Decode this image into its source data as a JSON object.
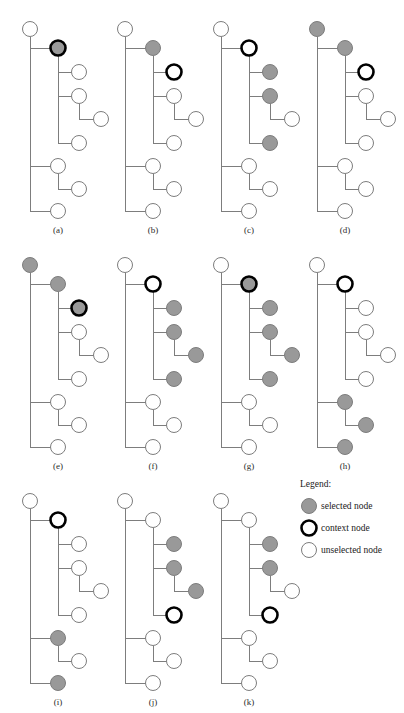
{
  "figure": {
    "width": 404,
    "height": 713,
    "background": "#ffffff"
  },
  "style": {
    "edge_color": "#7d7d7d",
    "node_stroke_normal": "#7d7d7d",
    "node_stroke_context": "#000000",
    "fill_selected": "#999999",
    "fill_unselected": "#ffffff",
    "node_radius": 7.5,
    "stroke_width_normal": 1,
    "stroke_width_context": 2.6
  },
  "legend": {
    "title": "Legend:",
    "items": [
      {
        "key": "selected",
        "label": "selected node",
        "state": "selected"
      },
      {
        "key": "context",
        "label": "context node",
        "state": "context"
      },
      {
        "key": "unselected",
        "label": "unselected node",
        "state": "unselected"
      }
    ]
  },
  "tree_structure": {
    "description": "Shared node skeleton used by all eleven panels; coordinates are relative to each panel origin.",
    "nodes": [
      {
        "id": "n0",
        "x": 28,
        "y": 29,
        "parent": null,
        "depth": 1
      },
      {
        "id": "n1",
        "x": 56,
        "y": 48,
        "parent": "n0",
        "depth": 2
      },
      {
        "id": "n2",
        "x": 77,
        "y": 72,
        "parent": "n1",
        "depth": 3
      },
      {
        "id": "n3",
        "x": 77,
        "y": 96,
        "parent": "n1",
        "depth": 3
      },
      {
        "id": "n4",
        "x": 99,
        "y": 119,
        "parent": "n3",
        "depth": 4
      },
      {
        "id": "n5",
        "x": 77,
        "y": 143,
        "parent": "n1",
        "depth": 3
      },
      {
        "id": "n6",
        "x": 56,
        "y": 166,
        "parent": "n0",
        "depth": 2
      },
      {
        "id": "n7",
        "x": 77,
        "y": 189,
        "parent": "n6",
        "depth": 3
      },
      {
        "id": "n8",
        "x": 56,
        "y": 211,
        "parent": "n0",
        "depth": 2
      }
    ]
  },
  "panels": [
    {
      "id": "a",
      "caption": "(a)",
      "origin": {
        "x": 2,
        "y": 0
      },
      "caption_pos": {
        "x": 58,
        "y": 233
      },
      "states": {
        "n0": "unselected",
        "n1": "selected-context",
        "n2": "unselected",
        "n3": "unselected",
        "n4": "unselected",
        "n5": "unselected",
        "n6": "unselected",
        "n7": "unselected",
        "n8": "unselected"
      }
    },
    {
      "id": "b",
      "caption": "(b)",
      "origin": {
        "x": 97,
        "y": 0
      },
      "caption_pos": {
        "x": 153,
        "y": 233
      },
      "states": {
        "n0": "unselected",
        "n1": "selected",
        "n2": "context",
        "n3": "unselected",
        "n4": "unselected",
        "n5": "unselected",
        "n6": "unselected",
        "n7": "unselected",
        "n8": "unselected"
      }
    },
    {
      "id": "c",
      "caption": "(c)",
      "origin": {
        "x": 193,
        "y": 0
      },
      "caption_pos": {
        "x": 249,
        "y": 233
      },
      "states": {
        "n0": "unselected",
        "n1": "context",
        "n2": "selected",
        "n3": "selected",
        "n4": "unselected",
        "n5": "selected",
        "n6": "unselected",
        "n7": "unselected",
        "n8": "unselected"
      }
    },
    {
      "id": "d",
      "caption": "(d)",
      "origin": {
        "x": 289,
        "y": 0
      },
      "caption_pos": {
        "x": 345,
        "y": 233
      },
      "states": {
        "n0": "selected",
        "n1": "selected",
        "n2": "context",
        "n3": "unselected",
        "n4": "unselected",
        "n5": "unselected",
        "n6": "unselected",
        "n7": "unselected",
        "n8": "unselected"
      }
    },
    {
      "id": "e",
      "caption": "(e)",
      "origin": {
        "x": 2,
        "y": 236
      },
      "caption_pos": {
        "x": 58,
        "y": 469
      },
      "states": {
        "n0": "selected",
        "n1": "selected",
        "n2": "selected-context",
        "n3": "unselected",
        "n4": "unselected",
        "n5": "unselected",
        "n6": "unselected",
        "n7": "unselected",
        "n8": "unselected"
      }
    },
    {
      "id": "f",
      "caption": "(f)",
      "origin": {
        "x": 97,
        "y": 236
      },
      "caption_pos": {
        "x": 153,
        "y": 469
      },
      "states": {
        "n0": "unselected",
        "n1": "context",
        "n2": "selected",
        "n3": "selected",
        "n4": "selected",
        "n5": "selected",
        "n6": "unselected",
        "n7": "unselected",
        "n8": "unselected"
      }
    },
    {
      "id": "g",
      "caption": "(g)",
      "origin": {
        "x": 193,
        "y": 236
      },
      "caption_pos": {
        "x": 249,
        "y": 469
      },
      "states": {
        "n0": "unselected",
        "n1": "selected-context",
        "n2": "selected",
        "n3": "selected",
        "n4": "selected",
        "n5": "selected",
        "n6": "unselected",
        "n7": "unselected",
        "n8": "unselected"
      }
    },
    {
      "id": "h",
      "caption": "(h)",
      "origin": {
        "x": 289,
        "y": 236
      },
      "caption_pos": {
        "x": 345,
        "y": 469
      },
      "states": {
        "n0": "unselected",
        "n1": "context",
        "n2": "unselected",
        "n3": "unselected",
        "n4": "unselected",
        "n5": "unselected",
        "n6": "selected",
        "n7": "selected",
        "n8": "selected"
      }
    },
    {
      "id": "i",
      "caption": "(i)",
      "origin": {
        "x": 2,
        "y": 472
      },
      "caption_pos": {
        "x": 58,
        "y": 705
      },
      "states": {
        "n0": "unselected",
        "n1": "context",
        "n2": "unselected",
        "n3": "unselected",
        "n4": "unselected",
        "n5": "unselected",
        "n6": "selected",
        "n7": "unselected",
        "n8": "selected"
      }
    },
    {
      "id": "j",
      "caption": "(j)",
      "origin": {
        "x": 97,
        "y": 472
      },
      "caption_pos": {
        "x": 153,
        "y": 705
      },
      "states": {
        "n0": "unselected",
        "n1": "unselected",
        "n2": "selected",
        "n3": "selected",
        "n4": "selected",
        "n5": "context",
        "n6": "unselected",
        "n7": "unselected",
        "n8": "unselected"
      }
    },
    {
      "id": "k",
      "caption": "(k)",
      "origin": {
        "x": 193,
        "y": 472
      },
      "caption_pos": {
        "x": 249,
        "y": 705
      },
      "states": {
        "n0": "unselected",
        "n1": "unselected",
        "n2": "selected",
        "n3": "selected",
        "n4": "unselected",
        "n5": "context",
        "n6": "unselected",
        "n7": "unselected",
        "n8": "unselected"
      }
    }
  ],
  "legend_layout": {
    "origin": {
      "x": 300,
      "y": 487
    },
    "title_pos": {
      "x": 0,
      "y": 0
    },
    "row_height": 22,
    "first_row_y": 22,
    "swatch_x": 9,
    "label_x": 21
  }
}
